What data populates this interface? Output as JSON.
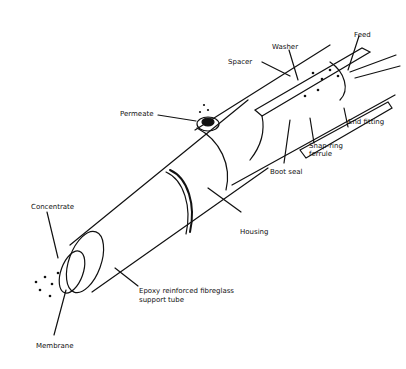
{
  "diagram": {
    "labels": {
      "feed": "Feed",
      "washer": "Washer",
      "spacer": "Spacer",
      "permeate": "Permeate",
      "end_fitting": "End fitting",
      "snap_ring_1": "Snap-ring",
      "snap_ring_2": "ferrule",
      "boot_seal": "Boot seal",
      "housing": "Housing",
      "concentrate": "Concentrate",
      "epoxy_1": "Epoxy reinforced fibreglass",
      "epoxy_2": "support tube",
      "membrane": "Membrane"
    },
    "colors": {
      "line": "#111111",
      "background": "#ffffff"
    }
  }
}
